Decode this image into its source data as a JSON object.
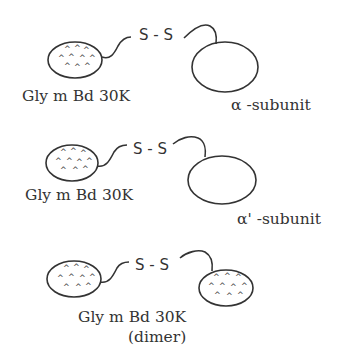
{
  "diagram": {
    "rows": [
      {
        "left_label": "Gly m Bd 30K",
        "bond": "S - S",
        "right_label": "α -subunit",
        "right_type": "plain"
      },
      {
        "left_label": "Gly m Bd 30K",
        "bond": "S - S",
        "right_label": "α' -subunit",
        "right_type": "plain"
      },
      {
        "left_label": "Gly m Bd 30K",
        "bond": "S - S",
        "right_label": "",
        "right_type": "dotted",
        "bottom_label_line2": "(dimer)"
      }
    ],
    "texture_glyph": "^",
    "colors": {
      "stroke": "#333333",
      "background": "#ffffff"
    }
  }
}
